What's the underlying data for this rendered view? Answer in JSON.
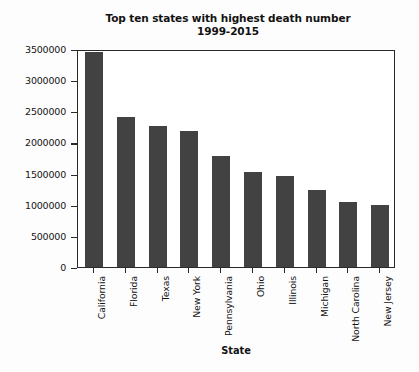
{
  "chart_data": {
    "type": "bar",
    "title": "Top ten states with highest death number\n1999-2015",
    "title_line1": "Top ten states with highest death number",
    "title_line2": "1999-2015",
    "xlabel": "State",
    "ylabel": "",
    "categories": [
      "California",
      "Florida",
      "Texas",
      "New York",
      "Pennsylvania",
      "Ohio",
      "Illinois",
      "Michigan",
      "North Carolina",
      "New Jersey"
    ],
    "values": [
      3450000,
      2410000,
      2270000,
      2190000,
      1790000,
      1530000,
      1460000,
      1240000,
      1050000,
      990000
    ],
    "ylim": [
      0,
      3500000
    ],
    "yticks": [
      0,
      500000,
      1000000,
      1500000,
      2000000,
      2500000,
      3000000,
      3500000
    ],
    "ytick_labels": [
      "0",
      "500000",
      "1000000",
      "1500000",
      "2000000",
      "2500000",
      "3000000",
      "3500000"
    ],
    "grid": false,
    "legend": null,
    "bar_color": "#424242",
    "axes_color": "#2a2a2a",
    "background_color": "#ffffff",
    "xtick_rotation": 90
  }
}
